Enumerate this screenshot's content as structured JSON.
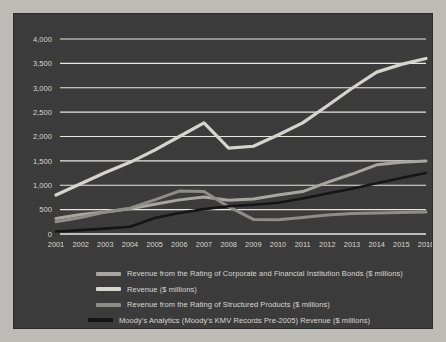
{
  "chart_data": {
    "type": "line",
    "title": "",
    "subtitle": "",
    "xlabel": "",
    "ylabel": "",
    "grid": true,
    "legend_position": "bottom",
    "xlim": [
      2001,
      2016
    ],
    "ylim": [
      0,
      4000
    ],
    "y_ticks": [
      "0",
      "500",
      "1,000",
      "1,500",
      "2,000",
      "2,500",
      "3,000",
      "3,500",
      "4,000"
    ],
    "y_tick_values": [
      0,
      500,
      1000,
      1500,
      2000,
      2500,
      3000,
      3500,
      4000
    ],
    "categories": [
      "2001",
      "2002",
      "2003",
      "2004",
      "2005",
      "2006",
      "2007",
      "2008",
      "2009",
      "2010",
      "2011",
      "2012",
      "2013",
      "2014",
      "2015",
      "2016"
    ],
    "series": [
      {
        "name": "Revenue ($ millions)",
        "color": "#d6d4cf",
        "width": 3.2,
        "values": [
          800,
          1030,
          1260,
          1470,
          1720,
          2000,
          2280,
          1760,
          1800,
          2030,
          2280,
          2630,
          2990,
          3320,
          3480,
          3600
        ]
      },
      {
        "name": "Revenue from the Rating of Corporate and Financial Institution Bonds ($ millions)",
        "color": "#a8a6a1",
        "width": 3.0,
        "values": [
          320,
          400,
          450,
          520,
          610,
          700,
          760,
          690,
          720,
          800,
          870,
          1060,
          1230,
          1420,
          1470,
          1500
        ]
      },
      {
        "name": "Revenue from the Rating of Structured Products ($ millions)",
        "color": "#8f8d88",
        "width": 3.0,
        "values": [
          250,
          340,
          450,
          530,
          700,
          880,
          870,
          560,
          300,
          290,
          340,
          390,
          420,
          430,
          440,
          450
        ]
      },
      {
        "name": "Moody's Analytics (Moody's KMV Records Pre-2005) Revenue ($ millions)",
        "color": "#151515",
        "width": 2.6,
        "values": [
          50,
          80,
          110,
          150,
          330,
          430,
          510,
          570,
          600,
          640,
          730,
          830,
          930,
          1040,
          1150,
          1250
        ]
      }
    ]
  },
  "legend": {
    "items": [
      {
        "label": "Revenue from the Rating of Corporate and Financial Institution Bonds ($ millions)",
        "color": "#a8a6a1"
      },
      {
        "label": "Revenue ($ millions)",
        "color": "#d6d4cf"
      },
      {
        "label": "Revenue from the Rating of Structured Products ($ millions)",
        "color": "#8f8d88"
      },
      {
        "label": "Moody's Analytics (Moody's KMV Records Pre-2005) Revenue ($ millions)",
        "color": "#151515"
      }
    ]
  },
  "colors": {
    "panel_background": "#3a3a3a",
    "page_background": "#bdbbb6",
    "gridline": "#e9e7e2",
    "tick_text": "#d8d6d2"
  }
}
